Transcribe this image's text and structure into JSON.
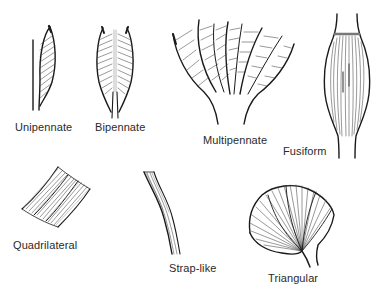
{
  "diagram": {
    "ink_color": "#1a1a1a",
    "background": "#ffffff",
    "shapes": [
      {
        "id": "unipennate",
        "label": "Unipennate"
      },
      {
        "id": "bipennate",
        "label": "Bipennate"
      },
      {
        "id": "multipennate",
        "label": "Multipennate"
      },
      {
        "id": "fusiform",
        "label": "Fusiform"
      },
      {
        "id": "quadrilateral",
        "label": "Quadrilateral"
      },
      {
        "id": "strap-like",
        "label": "Strap-like"
      },
      {
        "id": "triangular",
        "label": "Triangular"
      }
    ]
  }
}
